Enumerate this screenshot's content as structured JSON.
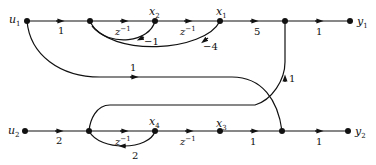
{
  "diagram": {
    "type": "signal-flow-graph",
    "nodes": {
      "u1": {
        "label": "u",
        "sub": "1"
      },
      "x2": {
        "label": "x",
        "sub": "2"
      },
      "x1": {
        "label": "x",
        "sub": "1"
      },
      "y1": {
        "label": "y",
        "sub": "1"
      },
      "u2": {
        "label": "u",
        "sub": "2"
      },
      "x4": {
        "label": "x",
        "sub": "4"
      },
      "x3": {
        "label": "x",
        "sub": "3"
      },
      "y2": {
        "label": "y",
        "sub": "2"
      }
    },
    "gains": {
      "u1_to_n1": "1",
      "n1_to_x2": "z",
      "n1_to_x2_exp": "−1",
      "x2_to_x1": "z",
      "x2_to_x1_exp": "−1",
      "x2_feedback": "−1",
      "x1_feedback": "−4",
      "x1_to_n3": "5",
      "n3_to_y1": "1",
      "u1_cross": "1",
      "n5_to_n3": "1",
      "u2_to_n4": "2",
      "n4_to_x4": "z",
      "n4_to_x4_exp": "−1",
      "x4_feedback": "2",
      "x4_to_x3": "z",
      "x4_to_x3_exp": "−1",
      "x3_to_n5": "1",
      "n5_to_y2": "1"
    }
  }
}
